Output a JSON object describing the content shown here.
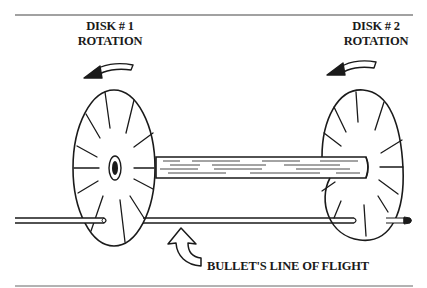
{
  "diagram": {
    "disk1": {
      "title": "DISK # 1",
      "subtitle": "ROTATION",
      "rotation_arrow": "curved-arrow-left-icon"
    },
    "disk2": {
      "title": "DISK # 2",
      "subtitle": "ROTATION",
      "rotation_arrow": "curved-arrow-left-icon"
    },
    "bullet_label": "BULLET'S LINE OF FLIGHT",
    "colors": {
      "ink": "#1a1a1a",
      "background": "#ffffff",
      "rule": "#555555"
    }
  }
}
